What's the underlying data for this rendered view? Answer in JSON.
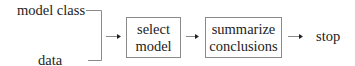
{
  "diagram": {
    "inputs": {
      "top": "model class",
      "bottom": "data"
    },
    "nodes": [
      {
        "id": "select",
        "lines": [
          "select",
          "model"
        ]
      },
      {
        "id": "summarize",
        "lines": [
          "summarize",
          "conclusions"
        ]
      }
    ],
    "terminal": "stop",
    "edges": [
      {
        "from": "inputs",
        "to": "select"
      },
      {
        "from": "select",
        "to": "summarize"
      },
      {
        "from": "summarize",
        "to": "stop"
      }
    ],
    "colors": {
      "line": "#8a8a8a",
      "arrowhead": "#222222",
      "text": "#222222"
    }
  }
}
